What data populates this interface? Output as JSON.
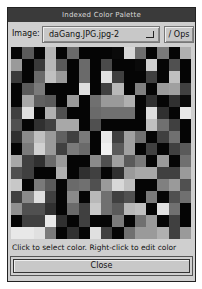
{
  "window": {
    "title": "Indexed Color Palette"
  },
  "toolbar": {
    "image_label": "Image:",
    "image_value": "daGang.JPG.jpg-2",
    "ops_label": "/ Ops"
  },
  "status": {
    "text": "Click to select color.  Right-click to edit color"
  },
  "footer": {
    "close_label": "Close"
  },
  "palette": {
    "columns": 16,
    "rows": 16,
    "colors": [
      [
        "#050505",
        "#5a5a5a",
        "#060606",
        "#b5b5b5",
        "#050505",
        "#6a6a6a",
        "#050505",
        "#050505",
        "#050505",
        "#0a0a0a",
        "#d8d8d8",
        "#6e6e6e",
        "#050505",
        "#7a7a7a",
        "#050505",
        "#b0b0b0"
      ],
      [
        "#9a9a9a",
        "#050505",
        "#3a3a3a",
        "#b8b8b8",
        "#5a5a5a",
        "#050505",
        "#6a6a6a",
        "#050505",
        "#4a4a4a",
        "#050505",
        "#050505",
        "#0a0a0a",
        "#d0d0d0",
        "#050505",
        "#505050",
        "#050505"
      ],
      [
        "#3a3a3a",
        "#050505",
        "#6a6a6a",
        "#c0c0c0",
        "#9a9a9a",
        "#050505",
        "#6a6a6a",
        "#050505",
        "#e0e0e0",
        "#404040",
        "#050505",
        "#050505",
        "#404040",
        "#050505",
        "#c0c0c0",
        "#050505"
      ],
      [
        "#050505",
        "#5a5a5a",
        "#7a7a7a",
        "#050505",
        "#050505",
        "#050505",
        "#dedede",
        "#050505",
        "#404040",
        "#b8b8b8",
        "#050505",
        "#808080",
        "#050505",
        "#9a9a9a",
        "#a0a0a0",
        "#404040"
      ],
      [
        "#050505",
        "#a8a8a8",
        "#606060",
        "#5a5a5a",
        "#050505",
        "#9a9a9a",
        "#050505",
        "#707070",
        "#9a9a9a",
        "#9a9a9a",
        "#b0b0b0",
        "#050505",
        "#303030",
        "#050505",
        "#303030",
        "#0a0a0a"
      ],
      [
        "#404040",
        "#e0e0e0",
        "#050505",
        "#b0b0b0",
        "#505050",
        "#050505",
        "#050505",
        "#6a6a6a",
        "#707070",
        "#707070",
        "#707070",
        "#050505",
        "#dddddd",
        "#303030",
        "#050505",
        "#e8e8e8"
      ],
      [
        "#505050",
        "#050505",
        "#303030",
        "#404040",
        "#a8a8a8",
        "#a8a8a8",
        "#050505",
        "#505050",
        "#050505",
        "#050505",
        "#050505",
        "#050505",
        "#c0c0c0",
        "#707070",
        "#404040",
        "#050505"
      ],
      [
        "#303030",
        "#8a8a8a",
        "#c0c0c0",
        "#9a9a9a",
        "#606060",
        "#404040",
        "#7a7a7a",
        "#050505",
        "#e8e8e8",
        "#404040",
        "#a0a0a0",
        "#707070",
        "#050505",
        "#404040",
        "#707070",
        "#050505"
      ],
      [
        "#050505",
        "#7a7a7a",
        "#d0d0d0",
        "#9a9a9a",
        "#404040",
        "#7a7a7a",
        "#6a6a6a",
        "#050505",
        "#f0f0f0",
        "#5a5a5a",
        "#a0a0a0",
        "#050505",
        "#404040",
        "#050505",
        "#404040",
        "#5a5a5a"
      ],
      [
        "#a8a8a8",
        "#404040",
        "#303030",
        "#6a6a6a",
        "#9a9a9a",
        "#050505",
        "#050505",
        "#8a8a8a",
        "#505050",
        "#a0a0a0",
        "#5a5a5a",
        "#7a7a7a",
        "#050505",
        "#9a9a9a",
        "#050505",
        "#707070"
      ],
      [
        "#505050",
        "#404040",
        "#050505",
        "#050505",
        "#b0b0b0",
        "#050505",
        "#303030",
        "#404040",
        "#050505",
        "#303030",
        "#9a9a9a",
        "#a8a8a8",
        "#a8a8a8",
        "#404040",
        "#404040",
        "#9a9a9a"
      ],
      [
        "#c8c8c8",
        "#050505",
        "#7a7a7a",
        "#5a5a5a",
        "#050505",
        "#6a6a6a",
        "#707070",
        "#505050",
        "#9a9a9a",
        "#d8d8d8",
        "#c0c0c0",
        "#050505",
        "#050505",
        "#808080",
        "#9a9a9a",
        "#505050"
      ],
      [
        "#404040",
        "#8a8a8a",
        "#dedede",
        "#404040",
        "#050505",
        "#8a8a8a",
        "#050505",
        "#b8b8b8",
        "#707070",
        "#404040",
        "#505050",
        "#050505",
        "#7a7a7a",
        "#050505",
        "#505050",
        "#707070"
      ],
      [
        "#909090",
        "#505050",
        "#505050",
        "#303030",
        "#050505",
        "#6a6a6a",
        "#404040",
        "#c8c8c8",
        "#707070",
        "#5a5a5a",
        "#b8b8b8",
        "#c0c0c0",
        "#050505",
        "#e0e0e0",
        "#707070",
        "#050505"
      ],
      [
        "#050505",
        "#404040",
        "#404040",
        "#e8e8e8",
        "#303030",
        "#050505",
        "#404040",
        "#050505",
        "#050505",
        "#7a7a7a",
        "#050505",
        "#707070",
        "#9a9a9a",
        "#050505",
        "#404040",
        "#050505"
      ],
      [
        "#e8e8e8",
        "#e8e8e8",
        "#e0e0e0",
        "#7a7a7a",
        "#050505",
        "#303030",
        "#050505",
        "#e0e0e0",
        "#404040",
        "#050505",
        "#707070",
        "#9a9a9a",
        "#9a9a9a",
        "#b0b0b0",
        "#404040",
        "#9a9a9a"
      ]
    ]
  }
}
